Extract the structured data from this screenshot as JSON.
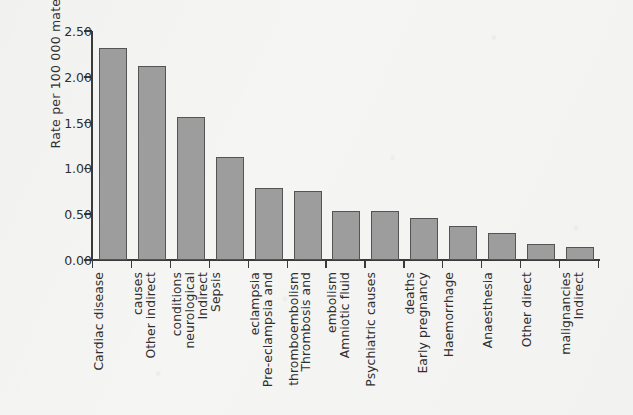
{
  "chart_data": {
    "type": "bar",
    "title": "",
    "xlabel": "",
    "ylabel": "Rate per 100 000 maternities",
    "ylim": [
      0.0,
      2.5
    ],
    "ytick_labels": [
      "0.00",
      "0.50",
      "1.00",
      "1.50",
      "2.00",
      "2.50"
    ],
    "ytick_values": [
      0.0,
      0.5,
      1.0,
      1.5,
      2.0,
      2.5
    ],
    "grid": false,
    "legend": "none",
    "bar_fill_color": "#9d9d9d",
    "bar_edge_color": "#545454",
    "background_color": "#f5f5f3",
    "categories": [
      "Cardiac disease",
      "Other indirect causes",
      "Indirect neurological conditions",
      "Sepsis",
      "Pre-eclampsia and eclampsia",
      "Thrombosis and thromboembolism",
      "Amniotic fluid embolism",
      "Psychiatric causes",
      "Early pregnancy deaths",
      "Haemorrhage",
      "Anaesthesia",
      "Other direct",
      "Indirect malignancies"
    ],
    "category_lines": [
      [
        "Cardiac disease"
      ],
      [
        "Other indirect",
        "causes"
      ],
      [
        "Indirect",
        "neurological",
        "conditions"
      ],
      [
        "Sepsis"
      ],
      [
        "Pre-eclampsia and",
        "eclampsia"
      ],
      [
        "Thrombosis and",
        "thromboembolism"
      ],
      [
        "Amniotic fluid",
        "embolism"
      ],
      [
        "Psychiatric causes"
      ],
      [
        "Early pregnancy",
        "deaths"
      ],
      [
        "Haemorrhage"
      ],
      [
        "Anaesthesia"
      ],
      [
        "Other direct"
      ],
      [
        "Indirect",
        "malignancies"
      ]
    ],
    "values": [
      2.31,
      2.12,
      1.56,
      1.12,
      0.79,
      0.75,
      0.53,
      0.53,
      0.46,
      0.37,
      0.3,
      0.18,
      0.14
    ]
  }
}
